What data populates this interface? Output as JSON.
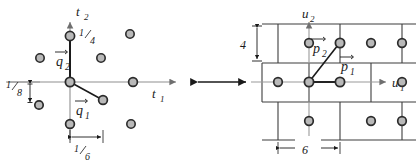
{
  "figure": {
    "name": "lattice-pair-diagram",
    "background": "#ffffff",
    "ink": "#1a1a1a",
    "axis_color": "#8c8c8c",
    "dot_fill": "#b9b9b9",
    "dot_stroke": "#2b2b2b",
    "grid_color": "#4a4a4a"
  },
  "left_panel": {
    "name": "t-lattice-panel",
    "axes": {
      "x_label": "t",
      "x_sub": "1",
      "y_label": "t",
      "y_sub": "2"
    },
    "vectors": [
      {
        "name": "q1",
        "label": "q",
        "sub": "1",
        "accent": "vec"
      },
      {
        "name": "q2",
        "label": "q",
        "sub": "2",
        "accent": "vec"
      }
    ],
    "measurements": [
      {
        "name": "quarter",
        "num": "1",
        "den": "4",
        "text": "1/4",
        "orientation": "point-label"
      },
      {
        "name": "eighth",
        "num": "1",
        "den": "8",
        "text": "1/8",
        "orientation": "vertical"
      },
      {
        "name": "sixth",
        "num": "1",
        "den": "6",
        "text": "1/6",
        "orientation": "horizontal"
      }
    ],
    "lattice_points": [
      {
        "x": 70,
        "y": 36
      },
      {
        "x": 40,
        "y": 58
      },
      {
        "x": 101,
        "y": 58
      },
      {
        "x": 130,
        "y": 34
      },
      {
        "x": 70,
        "y": 82
      },
      {
        "x": 133,
        "y": 82
      },
      {
        "x": 39,
        "y": 105
      },
      {
        "x": 103,
        "y": 100
      },
      {
        "x": 70,
        "y": 124
      },
      {
        "x": 131,
        "y": 124
      }
    ]
  },
  "middle": {
    "name": "equivalence-arrow",
    "type": "double-headed-arrow"
  },
  "right_panel": {
    "name": "u-lattice-panel",
    "axes": {
      "x_label": "u",
      "x_sub": "1",
      "y_label": "u",
      "y_sub": "2"
    },
    "vectors": [
      {
        "name": "p1",
        "label": "p",
        "sub": "1",
        "accent": "vec"
      },
      {
        "name": "p2",
        "label": "p",
        "sub": "2",
        "accent": "vec"
      }
    ],
    "measurements": [
      {
        "name": "height",
        "text": "4",
        "orientation": "vertical"
      },
      {
        "name": "width",
        "text": "6",
        "orientation": "horizontal"
      }
    ],
    "lattice_points": [
      {
        "x": 309,
        "y": 43
      },
      {
        "x": 372,
        "y": 43
      },
      {
        "x": 259,
        "y": 43
      },
      {
        "x": 278,
        "y": 82
      },
      {
        "x": 340,
        "y": 82
      },
      {
        "x": 402,
        "y": 82
      },
      {
        "x": 309,
        "y": 121
      },
      {
        "x": 372,
        "y": 121
      },
      {
        "x": 247,
        "y": 121
      },
      {
        "x": 340,
        "y": 43
      }
    ]
  }
}
